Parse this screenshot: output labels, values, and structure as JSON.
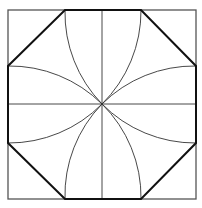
{
  "figure": {
    "title": "",
    "colors": {
      "background": "#ffffff",
      "square": "#555555",
      "octagon": "#111111",
      "lines": "#333333"
    },
    "square": {
      "x1": 8,
      "y1": 10,
      "x2": 196,
      "y2": 199
    },
    "center": {
      "x": 102,
      "y": 104
    },
    "octagon_vertices": [
      [
        65,
        10
      ],
      [
        141,
        10
      ],
      [
        196,
        66
      ],
      [
        196,
        143
      ],
      [
        141,
        199
      ],
      [
        65,
        199
      ],
      [
        8,
        143
      ],
      [
        8,
        66
      ]
    ]
  }
}
